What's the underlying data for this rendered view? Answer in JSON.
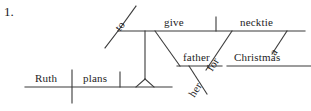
{
  "exercise": {
    "number_label": "1.",
    "type": "reed-kellogg-sentence-diagram",
    "sentence": "Ruth plans to give her father a necktie for Christmas."
  },
  "colors": {
    "ink": "#1d1d1d",
    "line": "#3a3a3a",
    "background": "#ffffff"
  },
  "words": {
    "subject": "Ruth",
    "main_verb": "plans",
    "infinitive_marker": "to",
    "infinitive_verb": "give",
    "indirect_object": "father",
    "indirect_object_modifier": "her",
    "direct_object": "necktie",
    "direct_object_article": "a",
    "preposition": "for",
    "prep_object": "Christmas"
  },
  "labels": {
    "ruth": "Ruth",
    "plans": "plans",
    "to": "to",
    "give": "give",
    "father": "father",
    "her": "her",
    "necktie": "necktie",
    "a": "a",
    "for": "for",
    "christmas": "Christmas"
  }
}
